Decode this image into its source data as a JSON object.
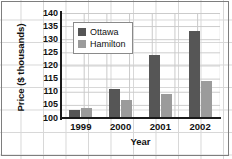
{
  "chart_data": {
    "type": "bar",
    "title": "",
    "xlabel": "Year",
    "ylabel": "Price ($ thousands)",
    "categories": [
      "1999",
      "2000",
      "2001",
      "2002"
    ],
    "series": [
      {
        "name": "Ottawa",
        "color": "#565656",
        "values": [
          103,
          111,
          124,
          133
        ]
      },
      {
        "name": "Hamilton",
        "color": "#9b9b9b",
        "values": [
          104,
          107,
          109,
          114
        ]
      }
    ],
    "ylim": [
      100,
      140
    ],
    "yticks": [
      100,
      105,
      110,
      115,
      120,
      125,
      130,
      135,
      140
    ],
    "grid": true,
    "legend_position": "upper-left"
  },
  "axes": {
    "y_title": "Price ($ thousands)",
    "x_title": "Year"
  },
  "legend": {
    "entries": [
      {
        "label": "Ottawa",
        "swatch": "ottawa-swatch"
      },
      {
        "label": "Hamilton",
        "swatch": "hamilton-swatch"
      }
    ]
  }
}
